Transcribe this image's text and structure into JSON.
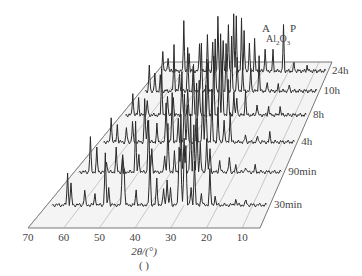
{
  "chart_data": {
    "type": "line",
    "subtype": "3d-waterfall (stacked XRD patterns)",
    "title": "",
    "xlabel": "2θ/(°)",
    "ylabel": "",
    "caption": "( )",
    "x_ticks": [
      70,
      60,
      50,
      40,
      30,
      20,
      10
    ],
    "x_range": [
      70,
      5
    ],
    "grid": true,
    "legend": "series labels at right end of each trace",
    "annotations": [
      {
        "text": "A",
        "x_2theta": 14,
        "series": "24h"
      },
      {
        "text": "Al2O3",
        "x_2theta": 11,
        "series": "24h"
      },
      {
        "text": "P",
        "x_2theta": 8,
        "series": "24h"
      }
    ],
    "series": [
      {
        "name": "30min",
        "peaks": [
          [
            64,
            0.55
          ],
          [
            63,
            0.35
          ],
          [
            59,
            0.25
          ],
          [
            56,
            0.2
          ],
          [
            53,
            0.9
          ],
          [
            52,
            0.3
          ],
          [
            48,
            0.85
          ],
          [
            47.5,
            0.6
          ],
          [
            44,
            0.25
          ],
          [
            40,
            0.85
          ],
          [
            38,
            0.45
          ],
          [
            36,
            0.3
          ],
          [
            35,
            0.45
          ],
          [
            34,
            0.3
          ],
          [
            31.5,
            1.0
          ],
          [
            31,
            0.95
          ],
          [
            30,
            0.95
          ],
          [
            29.5,
            1.0
          ],
          [
            28,
            0.3
          ],
          [
            27,
            0.75
          ],
          [
            25,
            0.2
          ],
          [
            22.5,
            0.6
          ],
          [
            21,
            0.15
          ],
          [
            15,
            0.1
          ],
          [
            12,
            0.08
          ]
        ]
      },
      {
        "name": "90min",
        "peaks": [
          [
            65,
            0.6
          ],
          [
            63,
            0.4
          ],
          [
            60,
            0.2
          ],
          [
            57,
            0.4
          ],
          [
            55,
            0.3
          ],
          [
            51,
            0.85
          ],
          [
            50,
            0.3
          ],
          [
            47,
            0.9
          ],
          [
            46,
            0.4
          ],
          [
            42,
            0.3
          ],
          [
            41,
            0.85
          ],
          [
            39,
            0.35
          ],
          [
            37,
            1.0
          ],
          [
            36,
            0.6
          ],
          [
            34,
            1.0
          ],
          [
            33,
            0.8
          ],
          [
            32,
            0.9
          ],
          [
            31,
            0.5
          ],
          [
            29,
            0.6
          ],
          [
            28,
            0.4
          ],
          [
            25,
            0.2
          ],
          [
            22,
            0.25
          ],
          [
            20,
            0.1
          ],
          [
            17,
            0.1
          ],
          [
            14,
            0.1
          ]
        ]
      },
      {
        "name": "4h",
        "peaks": [
          [
            66,
            0.45
          ],
          [
            64,
            0.3
          ],
          [
            61,
            0.25
          ],
          [
            59,
            0.35
          ],
          [
            55,
            0.75
          ],
          [
            54,
            0.4
          ],
          [
            51,
            0.3
          ],
          [
            48,
            0.7
          ],
          [
            46,
            0.85
          ],
          [
            44,
            0.4
          ],
          [
            42,
            0.85
          ],
          [
            41,
            0.65
          ],
          [
            38,
            1.0
          ],
          [
            36,
            0.9
          ],
          [
            35,
            1.0
          ],
          [
            33,
            0.9
          ],
          [
            31,
            0.6
          ],
          [
            29,
            0.4
          ],
          [
            27,
            0.5
          ],
          [
            22,
            0.12
          ],
          [
            18,
            0.1
          ],
          [
            14,
            0.15
          ]
        ]
      },
      {
        "name": "8h",
        "peaks": [
          [
            66,
            0.4
          ],
          [
            64,
            0.3
          ],
          [
            61,
            0.25
          ],
          [
            56,
            0.8
          ],
          [
            54,
            0.35
          ],
          [
            52,
            0.3
          ],
          [
            49,
            0.75
          ],
          [
            47,
            0.45
          ],
          [
            45,
            0.85
          ],
          [
            43,
            0.6
          ],
          [
            40,
            0.9
          ],
          [
            38,
            1.0
          ],
          [
            36,
            0.8
          ],
          [
            35,
            0.95
          ],
          [
            33,
            0.6
          ],
          [
            31,
            0.4
          ],
          [
            30,
            0.3
          ],
          [
            27,
            0.4
          ],
          [
            23,
            0.2
          ],
          [
            19,
            0.15
          ],
          [
            15,
            0.15
          ]
        ]
      },
      {
        "name": "10h",
        "peaks": [
          [
            67,
            0.45
          ],
          [
            65,
            0.3
          ],
          [
            63,
            0.25
          ],
          [
            58,
            0.8
          ],
          [
            56,
            0.3
          ],
          [
            53,
            0.75
          ],
          [
            51,
            0.4
          ],
          [
            48,
            0.85
          ],
          [
            46,
            0.55
          ],
          [
            43,
            0.9
          ],
          [
            41,
            1.0
          ],
          [
            39,
            0.8
          ],
          [
            37,
            0.95
          ],
          [
            35,
            0.6
          ],
          [
            33,
            0.4
          ],
          [
            30,
            0.4
          ],
          [
            27,
            0.6
          ],
          [
            24,
            0.15
          ],
          [
            20,
            0.1
          ],
          [
            16,
            0.1
          ]
        ]
      },
      {
        "name": "24h",
        "peaks": [
          [
            68,
            0.35
          ],
          [
            66,
            0.25
          ],
          [
            60,
            0.9
          ],
          [
            58,
            0.3
          ],
          [
            54,
            0.5
          ],
          [
            51,
            0.6
          ],
          [
            49,
            0.5
          ],
          [
            47,
            0.95
          ],
          [
            45,
            0.5
          ],
          [
            43,
            0.8
          ],
          [
            41,
            1.0
          ],
          [
            40,
            0.95
          ],
          [
            38,
            0.9
          ],
          [
            37,
            0.7
          ],
          [
            35,
            0.5
          ],
          [
            33,
            0.55
          ],
          [
            29,
            0.4
          ],
          [
            26,
            0.35
          ],
          [
            22,
            0.8
          ],
          [
            18,
            0.15
          ],
          [
            13,
            0.1
          ]
        ]
      }
    ]
  },
  "labels": {
    "xlabel": "2θ/(°)",
    "caption": "( )",
    "ann_A": "A",
    "ann_Al": "Al",
    "ann_sub2": "2",
    "ann_O": "O",
    "ann_sub3": "3",
    "ann_P": "P"
  }
}
